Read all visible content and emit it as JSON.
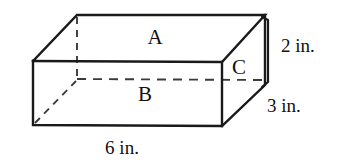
{
  "figure": {
    "kind": "rectangular-prism-diagram",
    "background_color": "#ffffff",
    "line_color": "#1a1a1a",
    "hidden_line_color": "#3a3a3a",
    "text_color": "#111111",
    "face_labels": {
      "top": "A",
      "front": "B",
      "right": "C"
    },
    "dimension_labels": {
      "height": "2 in.",
      "depth": "3 in.",
      "width": "6 in."
    },
    "geometry": {
      "front_top_left": [
        33,
        61
      ],
      "front_top_right": [
        222,
        62
      ],
      "front_bottom_left": [
        33,
        125
      ],
      "front_bottom_right": [
        222,
        126
      ],
      "back_top_left": [
        77,
        15
      ],
      "back_top_right": [
        265,
        15
      ],
      "back_bottom_left": [
        77,
        79
      ],
      "back_bottom_right": [
        265,
        85
      ]
    }
  }
}
